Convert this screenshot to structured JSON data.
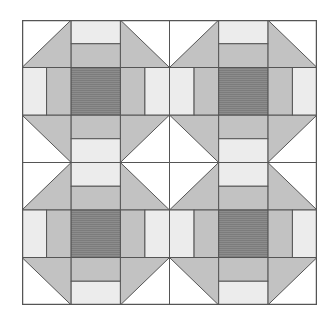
{
  "diagram": {
    "type": "quilt-pattern",
    "layout": {
      "blocks_x": 2,
      "blocks_y": 2,
      "cells_per_block": 3
    },
    "colors": {
      "background": "#ffffff",
      "white": "#ffffff",
      "light": "#ececec",
      "medium": "#c2c2c2",
      "dark": "#8c8c8c",
      "line": "#555555"
    }
  }
}
